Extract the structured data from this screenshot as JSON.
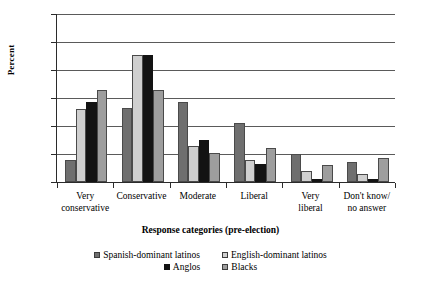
{
  "chart_data": {
    "type": "bar",
    "title": "",
    "xlabel": "Response categories (pre-election)",
    "ylabel": "Percent",
    "categories": [
      "Very\nconservative",
      "Conservative",
      "Moderate",
      "Liberal",
      "Very\nliberal",
      "Don't know/\nno answer"
    ],
    "series": [
      {
        "name": "Spanish-dominant latinos",
        "color": "#6f6f6f",
        "values": [
          8,
          26.5,
          28.5,
          21,
          10,
          7
        ]
      },
      {
        "name": "English-dominant latinos",
        "color": "#cfcfcf",
        "values": [
          26,
          45.5,
          13,
          8,
          4,
          3
        ]
      },
      {
        "name": "Anglos",
        "color": "#131313",
        "values": [
          28.5,
          45.2,
          15,
          6.5,
          1,
          1
        ]
      },
      {
        "name": "Blacks",
        "color": "#9e9e9e",
        "values": [
          33,
          33,
          10.5,
          12,
          6,
          8.5
        ]
      }
    ],
    "ylim": [
      0,
      60
    ],
    "yticks": [
      0,
      10,
      20,
      30,
      40,
      50,
      60
    ],
    "ytick_labels": [
      "0",
      "10",
      "20",
      "30",
      "40",
      "50",
      "60"
    ],
    "grid": true,
    "legend_position": "bottom"
  },
  "legend": {
    "row1": [
      "Spanish-dominant latinos",
      "English-dominant latinos"
    ],
    "row2": [
      "Anglos",
      "Blacks"
    ]
  }
}
